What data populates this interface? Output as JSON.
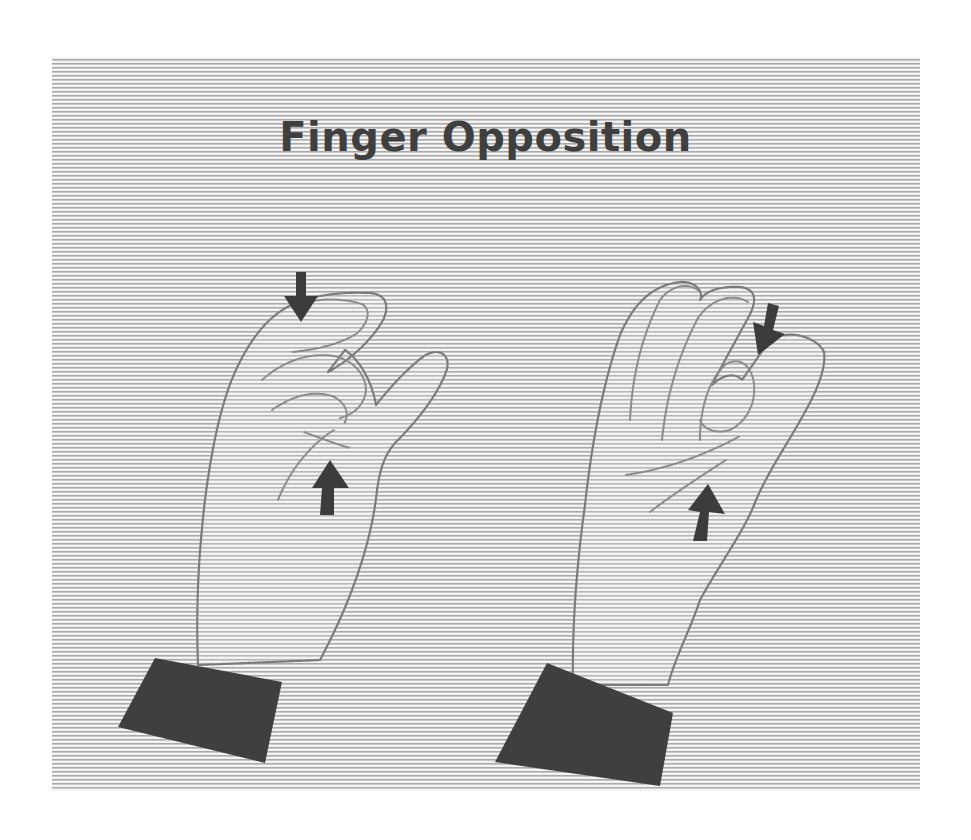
{
  "figure": {
    "title": "Finger Opposition",
    "background": "horizontal halftone stripes",
    "colors": {
      "stripe_light": "#f3f3f3",
      "stripe_dark": "#a9a9a9",
      "ink": "#3f3f3f",
      "outline": "#7a7a7a"
    },
    "illustrations": [
      {
        "id": "left-hand",
        "description": "Hand touching thumb to index finger",
        "arrows": [
          "down-arrow above fingertip",
          "up-arrow below thumb"
        ]
      },
      {
        "id": "right-hand",
        "description": "Hand touching thumb to ring finger",
        "arrows": [
          "down-arrow toward fingertip",
          "up-arrow below palm"
        ]
      }
    ]
  }
}
